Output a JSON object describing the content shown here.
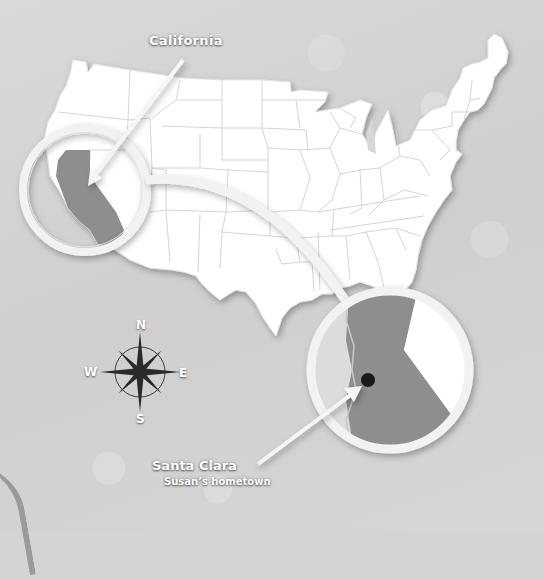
{
  "map": {
    "title": "United States",
    "highlighted_state": "California",
    "colors": {
      "background": "#d4d4d4",
      "land": "#ffffff",
      "state_border": "#c8c8c8",
      "highlight": "#8e8e8e",
      "ring": "#f2f2f2",
      "marker": "#1a1a1a"
    }
  },
  "labels": {
    "state": "California",
    "city": "Santa Clara",
    "city_caption": "Susan’s hometown"
  },
  "compass": {
    "north": "N",
    "south": "S",
    "east": "E",
    "west": "W"
  },
  "magnifiers": [
    {
      "name": "California overview",
      "cx": 85,
      "cy": 190,
      "r": 62
    },
    {
      "name": "Santa Clara detail",
      "cx": 390,
      "cy": 370,
      "r": 82
    }
  ]
}
